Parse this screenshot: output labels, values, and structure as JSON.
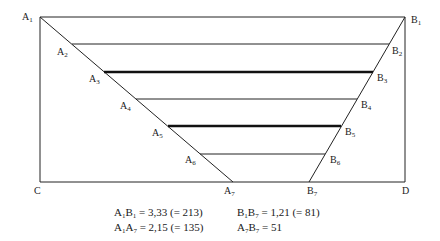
{
  "diagram": {
    "corner_labels": {
      "top_left": {
        "base": "A",
        "sub": "1"
      },
      "top_right": {
        "base": "B",
        "sub": "1"
      },
      "bottom_left": {
        "base": "C",
        "sub": ""
      },
      "bottom_right": {
        "base": "D",
        "sub": ""
      }
    },
    "a_points": [
      {
        "base": "A",
        "sub": "2"
      },
      {
        "base": "A",
        "sub": "3"
      },
      {
        "base": "A",
        "sub": "4"
      },
      {
        "base": "A",
        "sub": "5"
      },
      {
        "base": "A",
        "sub": "6"
      },
      {
        "base": "A",
        "sub": "7"
      }
    ],
    "b_points": [
      {
        "base": "B",
        "sub": "2"
      },
      {
        "base": "B",
        "sub": "3"
      },
      {
        "base": "B",
        "sub": "4"
      },
      {
        "base": "B",
        "sub": "5"
      },
      {
        "base": "B",
        "sub": "6"
      },
      {
        "base": "B",
        "sub": "7"
      }
    ],
    "emphasized_lines": [
      "A3B3",
      "A5B5"
    ]
  },
  "caption": {
    "line1": [
      {
        "label": "A1B1",
        "text": "= 3,33 (= 213)"
      },
      {
        "label": "B1B7",
        "text": "= 1,21 (= 81)"
      }
    ],
    "line2": [
      {
        "label": "A1A7",
        "text": "= 2,15 (= 135)"
      },
      {
        "label": "A7B7",
        "text": "= 51"
      }
    ]
  }
}
